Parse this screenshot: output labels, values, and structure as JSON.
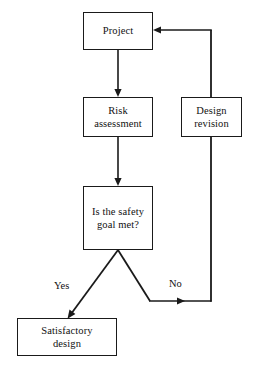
{
  "diagram": {
    "background_color": "#ffffff",
    "stroke_color": "#1a1a1a",
    "text_color": "#111111",
    "nodes": [
      {
        "id": "project",
        "label": "Project",
        "shape": "rectangle"
      },
      {
        "id": "risk",
        "label": "Risk\nassessment",
        "shape": "rectangle"
      },
      {
        "id": "design",
        "label": "Design\nrevision",
        "shape": "rectangle"
      },
      {
        "id": "decision",
        "label": "Is the safety\ngoal met?",
        "shape": "rectangle"
      },
      {
        "id": "satisfactory",
        "label": "Satisfactory\ndesign",
        "shape": "rectangle"
      }
    ],
    "edge_labels": {
      "yes": "Yes",
      "no": "No"
    },
    "edges": [
      {
        "from": "project",
        "to": "risk",
        "label": ""
      },
      {
        "from": "risk",
        "to": "decision",
        "label": ""
      },
      {
        "from": "decision",
        "to": "satisfactory",
        "label": "Yes"
      },
      {
        "from": "decision",
        "to": "design",
        "label": "No"
      },
      {
        "from": "design",
        "to": "project",
        "label": ""
      }
    ]
  }
}
